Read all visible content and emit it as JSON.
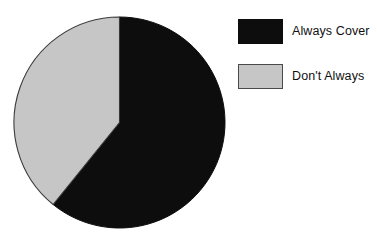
{
  "chart_data": {
    "type": "pie",
    "title": "",
    "subtitle": "",
    "xlabel": "",
    "ylabel": "",
    "grid": false,
    "legend_position": "right",
    "start_angle_deg": 0,
    "direction": "clockwise",
    "categories": [
      "Always Cover",
      "Don't Always"
    ],
    "values": [
      61,
      39
    ],
    "value_unit": "percent",
    "slices": [
      {
        "label": "Always Cover",
        "value": 61,
        "angle_deg": 219,
        "start_angle_deg": 0,
        "end_angle_deg": 219,
        "color": "#0d0d0d"
      },
      {
        "label": "Don't Always",
        "value": 39,
        "angle_deg": 141,
        "start_angle_deg": 219,
        "end_angle_deg": 360,
        "color": "#c6c6c6"
      }
    ],
    "annotations": []
  },
  "legend": {
    "items": [
      {
        "label": "Always Cover",
        "swatch": "legend-swatch-dark",
        "color": "#0d0d0d"
      },
      {
        "label": "Don't Always",
        "swatch": "legend-swatch-light",
        "color": "#c6c6c6"
      }
    ]
  },
  "colors": {
    "background": "#ffffff",
    "slice_dark": "#0d0d0d",
    "slice_light": "#c6c6c6",
    "outline": "#3a3a3a",
    "text": "#111111"
  }
}
